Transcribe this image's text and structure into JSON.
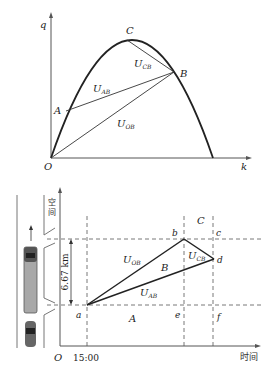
{
  "top_chart": {
    "axes": {
      "y_label": "q",
      "x_label": "k",
      "origin_label": "O"
    },
    "points": {
      "A": "A",
      "B": "B",
      "C": "C"
    },
    "segments": {
      "U_AB": {
        "main": "U",
        "sub": "AB"
      },
      "U_OB": {
        "main": "U",
        "sub": "OB"
      },
      "U_CB": {
        "main": "U",
        "sub": "CB"
      }
    },
    "colors": {
      "curve": "#222222",
      "lines": "#333333",
      "axis": "#555555"
    }
  },
  "bottom_chart": {
    "axes": {
      "y_label_top": "空",
      "y_label_bottom": "间",
      "x_label": "时间",
      "origin_label": "O",
      "x_tick": "15:00"
    },
    "distance_label": "6.67 km",
    "regions": {
      "A": "A",
      "B": "B",
      "C": "C"
    },
    "points": {
      "a": "a",
      "b": "b",
      "c": "c",
      "d": "d",
      "e": "e",
      "f": "f"
    },
    "segments": {
      "U_OB": {
        "main": "U",
        "sub": "OB"
      },
      "U_AB": {
        "main": "U",
        "sub": "AB"
      },
      "U_CB": {
        "main": "U",
        "sub": "CB"
      }
    },
    "colors": {
      "truck": "#a8a8a8",
      "truck_cab": "#444444",
      "car": "#555555",
      "road": "#777777"
    }
  }
}
